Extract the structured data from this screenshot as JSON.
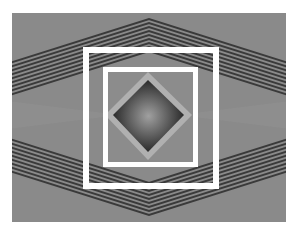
{
  "figure": {
    "colors": {
      "background": "#ffffff",
      "field": "#8a8a8a",
      "stripe_dark": "#3a3a3a",
      "stripe_light": "#8e8e8e",
      "frame": "#ffffff",
      "diamond_dark": "#2a2a2a",
      "diamond_halo": "#b8b8b8",
      "center_glow": "#9a9a9a"
    },
    "stripe_count_per_band": 9
  }
}
